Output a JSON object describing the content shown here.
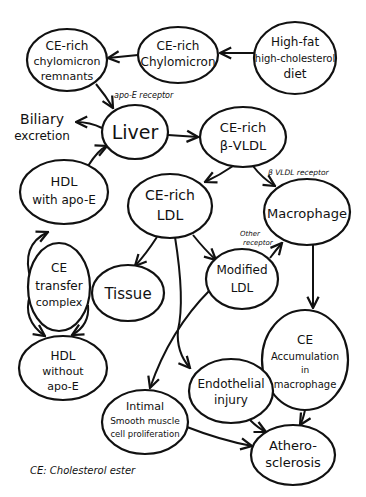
{
  "diagram": {
    "footnote": "CE: Cholesterol ester",
    "nodes": {
      "remnants": {
        "lines": [
          "CE-rich",
          "chylomicron",
          "remnants"
        ]
      },
      "chylomicron": {
        "lines": [
          "CE-rich",
          "Chylomicron"
        ]
      },
      "diet": {
        "lines": [
          "High-fat",
          "high-cholesterol",
          "diet"
        ]
      },
      "liver": {
        "lines": [
          "Liver"
        ]
      },
      "vldl": {
        "lines": [
          "CE-rich",
          "β-VLDL"
        ]
      },
      "biliary": {
        "lines": [
          "Biliary",
          "excretion"
        ]
      },
      "hdl_apoe": {
        "lines": [
          "HDL",
          "with apo-E"
        ]
      },
      "ldl": {
        "lines": [
          "CE-rich",
          "LDL"
        ]
      },
      "macrophage": {
        "lines": [
          "Macrophage"
        ]
      },
      "transfer": {
        "lines": [
          "CE",
          "transfer",
          "complex"
        ]
      },
      "tissue": {
        "lines": [
          "Tissue"
        ]
      },
      "modified_ldl": {
        "lines": [
          "Modified",
          "LDL"
        ]
      },
      "hdl_no_apoe": {
        "lines": [
          "HDL",
          "without",
          "apo-E"
        ]
      },
      "accumulation": {
        "lines": [
          "CE",
          "Accumulation",
          "in",
          "macrophage"
        ]
      },
      "endothelial": {
        "lines": [
          "Endothelial",
          "injury"
        ]
      },
      "intimal": {
        "lines": [
          "Intimal",
          "Smooth muscle",
          "cell proliferation"
        ]
      },
      "athero": {
        "lines": [
          "Athero-",
          "sclerosis"
        ]
      }
    },
    "edge_labels": {
      "apoe_receptor": "apo-E receptor",
      "vldl_receptor": "β VLDL receptor",
      "other_receptor_1": "Other",
      "other_receptor_2": "receptor"
    },
    "edges": [
      {
        "from": "diet",
        "to": "chylomicron"
      },
      {
        "from": "chylomicron",
        "to": "remnants"
      },
      {
        "from": "remnants",
        "to": "liver",
        "label": "apo-E receptor"
      },
      {
        "from": "liver",
        "to": "biliary"
      },
      {
        "from": "liver",
        "to": "vldl"
      },
      {
        "from": "vldl",
        "to": "ldl"
      },
      {
        "from": "vldl",
        "to": "macrophage",
        "label": "β VLDL receptor"
      },
      {
        "from": "hdl_apoe",
        "to": "liver"
      },
      {
        "from": "transfer",
        "to": "hdl_apoe"
      },
      {
        "from": "transfer",
        "to": "hdl_no_apoe"
      },
      {
        "from": "ldl",
        "to": "tissue"
      },
      {
        "from": "ldl",
        "to": "modified_ldl"
      },
      {
        "from": "ldl",
        "to": "endothelial"
      },
      {
        "from": "modified_ldl",
        "to": "macrophage",
        "label": "Other receptor"
      },
      {
        "from": "modified_ldl",
        "to": "intimal"
      },
      {
        "from": "macrophage",
        "to": "accumulation"
      },
      {
        "from": "accumulation",
        "to": "athero"
      },
      {
        "from": "endothelial",
        "to": "athero"
      },
      {
        "from": "intimal",
        "to": "athero"
      }
    ]
  }
}
